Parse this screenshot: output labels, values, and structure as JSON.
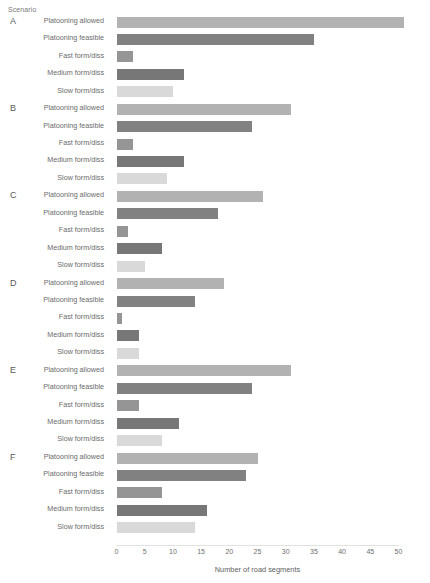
{
  "labels": {
    "scenario_axis": "Scenario"
  },
  "chart_data": {
    "type": "bar",
    "orientation": "horizontal",
    "title": "",
    "xlabel": "Number of road segments",
    "ylabel": "Scenario",
    "xlim": [
      0,
      52
    ],
    "xticks": [
      0,
      5,
      10,
      15,
      20,
      25,
      30,
      35,
      40,
      45,
      50
    ],
    "grid": false,
    "legend": "none",
    "categories": [
      "Platooning allowed",
      "Platooning feasible",
      "Fast form/diss",
      "Medium form/diss",
      "Slow form/diss"
    ],
    "category_colors": [
      "#b2b2b2",
      "#818181",
      "#959595",
      "#777777",
      "#d9d9d9"
    ],
    "groups": [
      "A",
      "B",
      "C",
      "D",
      "E",
      "F"
    ],
    "series": [
      {
        "name": "A",
        "values": [
          51,
          35,
          3,
          12,
          10
        ]
      },
      {
        "name": "B",
        "values": [
          31,
          24,
          3,
          12,
          9
        ]
      },
      {
        "name": "C",
        "values": [
          26,
          18,
          2,
          8,
          5
        ]
      },
      {
        "name": "D",
        "values": [
          19,
          14,
          1,
          4,
          4
        ]
      },
      {
        "name": "E",
        "values": [
          31,
          24,
          4,
          11,
          8
        ]
      },
      {
        "name": "F",
        "values": [
          25,
          23,
          8,
          16,
          14
        ]
      }
    ]
  }
}
